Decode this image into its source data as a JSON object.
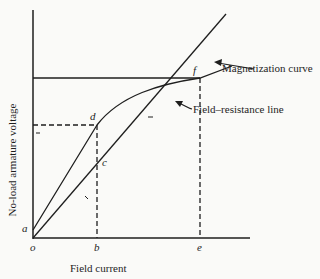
{
  "diagram": {
    "axes": {
      "y_label": "No-load armature voltage",
      "x_label": "Field current"
    },
    "points": {
      "o": "o",
      "a": "a",
      "b": "b",
      "c": "c",
      "d": "d",
      "e": "e",
      "f": "f"
    },
    "annotations": {
      "magnetization_curve": "Magnetization curve",
      "field_resistance_line": "Field–resistance line"
    },
    "colors": {
      "ink": "#1e1e1e",
      "background": "#fafaf8"
    }
  }
}
